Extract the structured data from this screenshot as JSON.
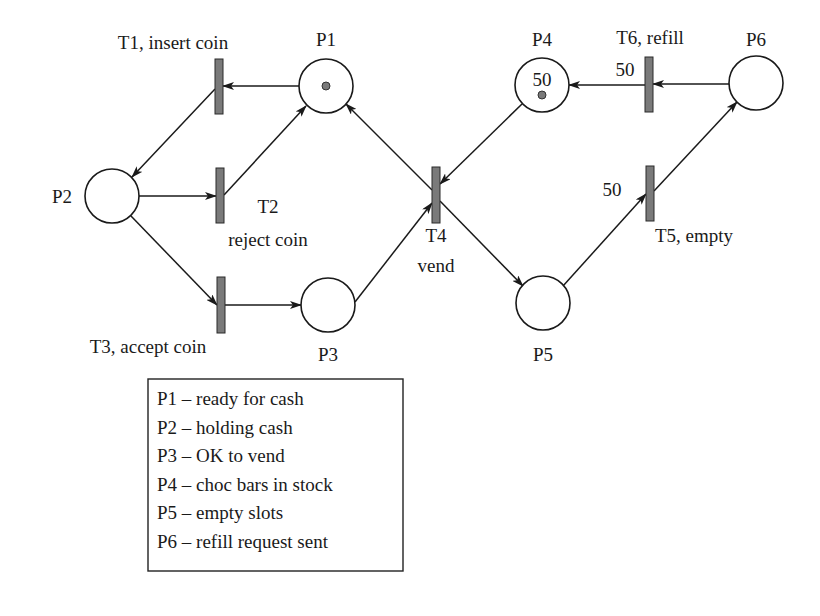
{
  "diagram": {
    "title_type": "Petri net - chocolate vending machine",
    "places": [
      {
        "id": "P1",
        "label": "P1",
        "cx": 326,
        "cy": 86,
        "r": 27,
        "tokens": 1,
        "capacity": "",
        "label_x": 326,
        "label_y": 46,
        "anchor": "middle"
      },
      {
        "id": "P2",
        "label": "P2",
        "cx": 112,
        "cy": 196,
        "r": 27,
        "tokens": 0,
        "capacity": "",
        "label_x": 62,
        "label_y": 203,
        "anchor": "middle"
      },
      {
        "id": "P3",
        "label": "P3",
        "cx": 328,
        "cy": 305,
        "r": 27,
        "tokens": 0,
        "capacity": "",
        "label_x": 328,
        "label_y": 361,
        "anchor": "middle"
      },
      {
        "id": "P4",
        "label": "P4",
        "cx": 542,
        "cy": 85,
        "r": 27,
        "tokens": 1,
        "capacity": "50",
        "label_x": 542,
        "label_y": 46,
        "anchor": "middle"
      },
      {
        "id": "P5",
        "label": "P5",
        "cx": 543,
        "cy": 303,
        "r": 27,
        "tokens": 0,
        "capacity": "",
        "label_x": 543,
        "label_y": 361,
        "anchor": "middle"
      },
      {
        "id": "P6",
        "label": "P6",
        "cx": 756,
        "cy": 83,
        "r": 27,
        "tokens": 0,
        "capacity": "",
        "label_x": 756,
        "label_y": 46,
        "anchor": "middle"
      }
    ],
    "transitions": [
      {
        "id": "T1",
        "x": 215,
        "y": 59,
        "w": 8,
        "h": 55
      },
      {
        "id": "T2",
        "x": 216,
        "y": 168,
        "w": 8,
        "h": 55
      },
      {
        "id": "T3",
        "x": 217,
        "y": 277,
        "w": 8,
        "h": 56
      },
      {
        "id": "T4",
        "x": 432,
        "y": 167,
        "w": 8,
        "h": 56
      },
      {
        "id": "T5",
        "x": 646,
        "y": 166,
        "w": 8,
        "h": 55
      },
      {
        "id": "T6",
        "x": 645,
        "y": 57,
        "w": 8,
        "h": 55
      }
    ],
    "transition_labels": [
      {
        "id": "T1",
        "text": "T1, insert coin",
        "x": 173,
        "y": 49,
        "anchor": "middle"
      },
      {
        "id": "T2a",
        "text": "T2",
        "x": 268,
        "y": 213,
        "anchor": "middle"
      },
      {
        "id": "T2b",
        "text": "reject coin",
        "x": 268,
        "y": 246,
        "anchor": "middle"
      },
      {
        "id": "T3",
        "text": "T3, accept coin",
        "x": 148,
        "y": 353,
        "anchor": "middle"
      },
      {
        "id": "T4a",
        "text": "T4",
        "x": 436,
        "y": 242,
        "anchor": "middle"
      },
      {
        "id": "T4b",
        "text": "vend",
        "x": 436,
        "y": 272,
        "anchor": "middle"
      },
      {
        "id": "T5",
        "text": "T5, empty",
        "x": 694,
        "y": 242,
        "anchor": "middle"
      },
      {
        "id": "T6",
        "text": "T6, refill",
        "x": 650,
        "y": 44,
        "anchor": "middle"
      }
    ],
    "arc_weights": [
      {
        "id": "T6-out",
        "text": "50",
        "x": 625,
        "y": 76,
        "anchor": "middle"
      },
      {
        "id": "T5-in",
        "text": "50",
        "x": 612,
        "y": 196,
        "anchor": "middle"
      }
    ],
    "arcs": [
      {
        "from": "P1",
        "to": "T1",
        "x1": 299,
        "y1": 86,
        "x2": 223,
        "y2": 86
      },
      {
        "from": "T1",
        "to": "P2",
        "x1": 215,
        "y1": 89,
        "x2": 132,
        "y2": 177
      },
      {
        "from": "P2",
        "to": "T2",
        "x1": 139,
        "y1": 196,
        "x2": 216,
        "y2": 196
      },
      {
        "from": "T2",
        "to": "P1",
        "x1": 224,
        "y1": 195,
        "x2": 306,
        "y2": 106
      },
      {
        "from": "P2",
        "to": "T3",
        "x1": 131,
        "y1": 216,
        "x2": 217,
        "y2": 305
      },
      {
        "from": "T3",
        "to": "P3",
        "x1": 225,
        "y1": 305,
        "x2": 301,
        "y2": 305
      },
      {
        "from": "P3",
        "to": "T4",
        "x1": 355,
        "y1": 302,
        "x2": 432,
        "y2": 203
      },
      {
        "from": "P4",
        "to": "T4",
        "x1": 522,
        "y1": 104,
        "x2": 440,
        "y2": 184
      },
      {
        "from": "T4",
        "to": "P1",
        "x1": 432,
        "y1": 190,
        "x2": 346,
        "y2": 104
      },
      {
        "from": "T4",
        "to": "P5",
        "x1": 440,
        "y1": 201,
        "x2": 523,
        "y2": 286
      },
      {
        "from": "P5",
        "to": "T5",
        "x1": 563,
        "y1": 286,
        "x2": 646,
        "y2": 194
      },
      {
        "from": "T5",
        "to": "P6",
        "x1": 654,
        "y1": 191,
        "x2": 737,
        "y2": 102
      },
      {
        "from": "P6",
        "to": "T6",
        "x1": 729,
        "y1": 84,
        "x2": 653,
        "y2": 84
      },
      {
        "from": "T6",
        "to": "P4",
        "x1": 645,
        "y1": 85,
        "x2": 569,
        "y2": 85
      }
    ],
    "legend": {
      "box": {
        "x": 148,
        "y": 379,
        "w": 255,
        "h": 192
      },
      "items": [
        "P1 – ready for cash",
        "P2 – holding cash",
        "P3 – OK to vend",
        "P4 – choc bars in stock",
        "P5 – empty slots",
        "P6 – refill request sent"
      ]
    }
  }
}
